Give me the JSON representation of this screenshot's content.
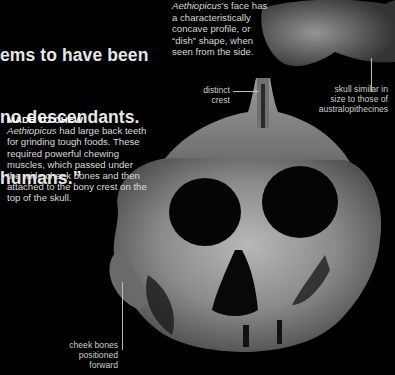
{
  "quote": {
    "lines": [
      "ems to have been",
      "no descendants.",
      "humans.”"
    ]
  },
  "side_caption": {
    "species": "Aethiopicus",
    "text": "’s face has a characteristically concave profile, or “dish” shape, when seen from the side."
  },
  "labels": {
    "crest": [
      "distinct",
      "crest"
    ],
    "skull_size": [
      "skull similar in",
      "size to those of",
      "australopithecines"
    ],
    "cheek": [
      "cheek bones",
      "positioned",
      "forward"
    ]
  },
  "chew_box": {
    "heading": "MADE TO CHEW",
    "species": "Aethiopicus",
    "text": " had large back teeth for grinding tough foods. These required powerful chewing muscles, which passed under the wide cheek bones and then attached to the bony crest on the top of the skull."
  },
  "colors": {
    "background": "#000000",
    "text": "#e6e6e6",
    "leader_line": "#bdbdbd"
  }
}
